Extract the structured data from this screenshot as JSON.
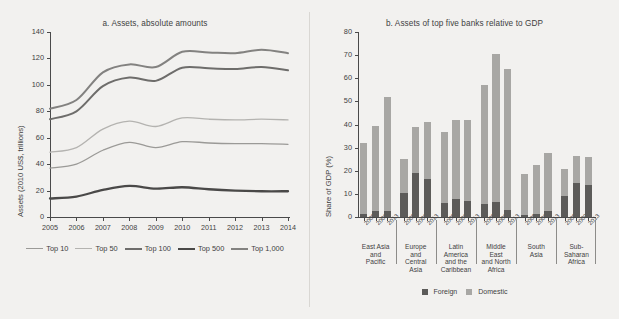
{
  "figure": {
    "background": "#f2f1ef"
  },
  "chart_data": [
    {
      "type": "line",
      "panel": "a",
      "title": "a. Assets, absolute amounts",
      "xlabel": "",
      "ylabel": "Assets (2010 US$, trillions)",
      "x": [
        2005,
        2006,
        2007,
        2008,
        2009,
        2010,
        2011,
        2012,
        2013,
        2014
      ],
      "xlim": [
        2005,
        2014
      ],
      "ylim": [
        0,
        140
      ],
      "yticks": [
        0,
        20,
        40,
        60,
        80,
        100,
        120,
        140
      ],
      "xticks": [
        "2005",
        "2006",
        "2007",
        "2008",
        "2009",
        "2010",
        "2011",
        "2012",
        "2013",
        "2014"
      ],
      "grid": false,
      "legend_position": "bottom",
      "series": [
        {
          "name": "Top 10",
          "color": "#9b9a97",
          "width": 1.3,
          "values": [
            37.0,
            40.0,
            50.5,
            56.5,
            52.5,
            57.0,
            56.0,
            55.5,
            55.5,
            55.0
          ]
        },
        {
          "name": "Top 50",
          "color": "#b4b3b0",
          "width": 1.3,
          "values": [
            49.0,
            52.5,
            66.5,
            72.5,
            68.5,
            75.0,
            74.0,
            73.5,
            74.0,
            73.5
          ]
        },
        {
          "name": "Top 100",
          "color": "#6e6d6b",
          "width": 2.0,
          "values": [
            74.0,
            80.0,
            99.0,
            105.5,
            103.0,
            113.0,
            112.5,
            112.0,
            113.5,
            111.0
          ]
        },
        {
          "name": "Top 500",
          "color": "#4a4948",
          "width": 2.3,
          "values": [
            14.0,
            15.5,
            20.5,
            23.5,
            21.5,
            22.5,
            21.0,
            20.0,
            19.5,
            19.5
          ]
        },
        {
          "name": "Top 1,000",
          "color": "#838280",
          "width": 2.0,
          "values": [
            82.0,
            88.5,
            109.5,
            115.5,
            113.5,
            125.0,
            124.5,
            124.0,
            126.5,
            124.0
          ]
        }
      ]
    },
    {
      "type": "bar",
      "panel": "b",
      "title": "b. Assets of top five banks relative to GDP",
      "xlabel": "",
      "ylabel": "Share of GDP (%)",
      "ylim": [
        0,
        80
      ],
      "yticks": [
        0,
        10,
        20,
        30,
        40,
        50,
        60,
        70,
        80
      ],
      "stacked": true,
      "grid": false,
      "legend_position": "bottom",
      "legend": [
        "Foreign",
        "Domestic"
      ],
      "colors": {
        "foreign": "#5c5b59",
        "domestic": "#a8a7a4"
      },
      "groups": [
        {
          "label": "East Asia\nand\nPacific",
          "label_lines": [
            "East Asia",
            "and",
            "Pacific"
          ]
        },
        {
          "label": "Europe\nand\nCentral\nAsia",
          "label_lines": [
            "Europe",
            "and",
            "Central",
            "Asia"
          ]
        },
        {
          "label": "Latin\nAmerica\nand the\nCaribbean",
          "label_lines": [
            "Latin",
            "America",
            "and the",
            "Caribbean"
          ]
        },
        {
          "label": "Middle\nEast\nand North\nAfrica",
          "label_lines": [
            "Middle",
            "East",
            "and North",
            "Africa"
          ]
        },
        {
          "label": "South\nAsia",
          "label_lines": [
            "South",
            "Asia"
          ]
        },
        {
          "label": "Sub-\nSaharan\nAfrica",
          "label_lines": [
            "Sub-",
            "Saharan",
            "Africa"
          ]
        }
      ],
      "categories": [
        "2005",
        "2009",
        "2013",
        "2005",
        "2009",
        "2013",
        "2005",
        "2009",
        "2013",
        "2005",
        "2009",
        "2013",
        "2005",
        "2009",
        "2013",
        "2005",
        "2009",
        "2013"
      ],
      "series": [
        {
          "name": "Foreign",
          "values": [
            1.5,
            2.7,
            2.8,
            10.6,
            19.2,
            16.6,
            6.2,
            8.0,
            7.0,
            5.8,
            6.7,
            3.0,
            1.0,
            1.3,
            2.6,
            9.0,
            14.6,
            14.0
          ]
        },
        {
          "name": "Domestic",
          "values": [
            30.5,
            36.7,
            49.2,
            14.6,
            19.7,
            24.5,
            30.6,
            34.1,
            34.9,
            51.2,
            63.8,
            61.2,
            17.4,
            21.0,
            25.3,
            11.8,
            11.7,
            12.0
          ]
        }
      ],
      "totals": [
        32.0,
        39.4,
        52.0,
        25.2,
        38.9,
        41.1,
        36.8,
        42.1,
        41.9,
        57.0,
        70.5,
        64.2,
        18.4,
        22.3,
        27.9,
        20.8,
        26.3,
        26.0
      ]
    }
  ]
}
